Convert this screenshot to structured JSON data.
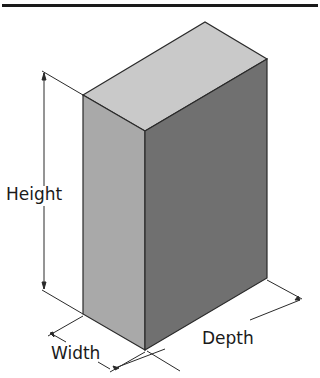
{
  "header": {
    "title_fragment": "FIGURE FOLIO"
  },
  "figure": {
    "type": "isometric rectangular box with dimension lines",
    "colors": {
      "top_face": "#c9c9c9",
      "left_face": "#a9a9a9",
      "right_face": "#707070",
      "edge": "#2a2a2a"
    },
    "labels": {
      "height": "Height",
      "width": "Width",
      "depth": "Depth"
    }
  }
}
